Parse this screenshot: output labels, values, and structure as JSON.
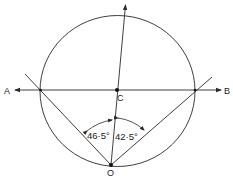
{
  "diagram": {
    "type": "geometry",
    "colors": {
      "line": "#2a2a2a",
      "background": "#ffffff"
    },
    "points": {
      "A": {
        "label": "A"
      },
      "B": {
        "label": "B"
      },
      "C": {
        "label": "C"
      },
      "O": {
        "label": "O"
      }
    },
    "angles": {
      "left": {
        "label": "46·5°"
      },
      "right": {
        "label": "42·5°"
      }
    }
  }
}
